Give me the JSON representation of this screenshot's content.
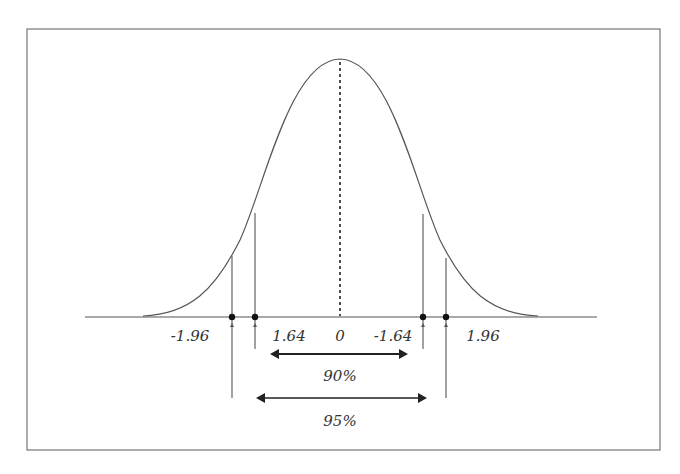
{
  "figure": {
    "center_label": "0",
    "critical_values": {
      "left_95": "-1.96",
      "left_90": "1.64",
      "right_90": "-1.64",
      "right_95": "1.96"
    },
    "intervals": {
      "inner": "90%",
      "outer": "95%"
    },
    "colors": {
      "line": "#555555",
      "text": "#333333",
      "border": "#777777"
    }
  }
}
